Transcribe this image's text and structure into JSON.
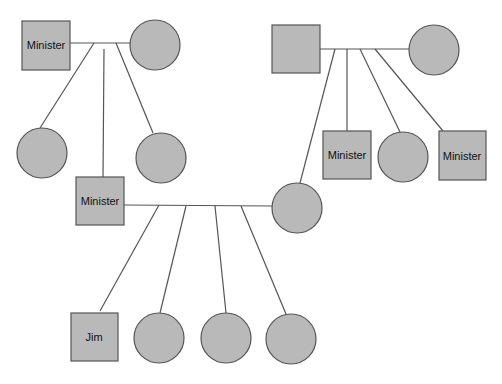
{
  "diagram": {
    "type": "genogram",
    "colors": {
      "fill": "#b9b9b9",
      "stroke": "#555555",
      "text": "#111111"
    },
    "nodes": [
      {
        "id": "gp1_male",
        "shape": "square",
        "label": "Minister",
        "x": 22,
        "y": 21,
        "size": 48
      },
      {
        "id": "gp1_female",
        "shape": "circle",
        "label": "",
        "cx": 155,
        "cy": 45,
        "r": 25
      },
      {
        "id": "gp1_child_f1",
        "shape": "circle",
        "label": "",
        "cx": 42,
        "cy": 153,
        "r": 25
      },
      {
        "id": "gp1_child_m",
        "shape": "square",
        "label": "Minister",
        "x": 76,
        "y": 177,
        "size": 48
      },
      {
        "id": "gp1_child_f2",
        "shape": "circle",
        "label": "",
        "cx": 161,
        "cy": 158,
        "r": 25
      },
      {
        "id": "gp2_male",
        "shape": "square",
        "label": "",
        "x": 272,
        "y": 25,
        "size": 48
      },
      {
        "id": "gp2_female",
        "shape": "circle",
        "label": "",
        "cx": 434,
        "cy": 50,
        "r": 25
      },
      {
        "id": "gp2_child_f_spouse",
        "shape": "circle",
        "label": "",
        "cx": 297,
        "cy": 208,
        "r": 25
      },
      {
        "id": "gp2_child_m1",
        "shape": "square",
        "label": "Minister",
        "x": 323,
        "y": 131,
        "size": 48
      },
      {
        "id": "gp2_child_f",
        "shape": "circle",
        "label": "",
        "cx": 403,
        "cy": 157,
        "r": 25
      },
      {
        "id": "gp2_child_m2",
        "shape": "square",
        "label": "Minister",
        "x": 439,
        "y": 131,
        "size": 48
      },
      {
        "id": "child_jim",
        "shape": "square",
        "label": "Jim",
        "x": 71,
        "y": 313,
        "size": 48
      },
      {
        "id": "child_f1",
        "shape": "circle",
        "label": "",
        "cx": 159,
        "cy": 338,
        "r": 25
      },
      {
        "id": "child_f2",
        "shape": "circle",
        "label": "",
        "cx": 226,
        "cy": 338,
        "r": 25
      },
      {
        "id": "child_f3",
        "shape": "circle",
        "label": "",
        "cx": 291,
        "cy": 339,
        "r": 25
      }
    ],
    "labels": {
      "gp1_male": "Minister",
      "gp1_child_m": "Minister",
      "gp2_child_m1": "Minister",
      "gp2_child_m2": "Minister",
      "child_jim": "Jim"
    }
  }
}
